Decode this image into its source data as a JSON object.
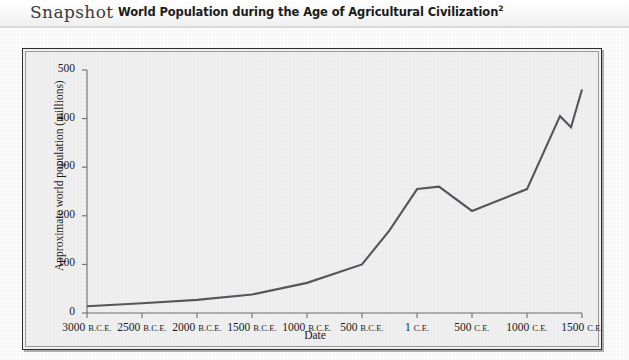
{
  "header": {
    "snapshot_label": "Snapshot",
    "title": "World Population during the Age of Agricultural Civilization",
    "title_superscript": "2"
  },
  "chart_data": {
    "type": "line",
    "title": "World Population during the Age of Agricultural Civilization",
    "xlabel": "Date",
    "ylabel": "Approximate world population (millions)",
    "xlim": [
      -3000,
      1500
    ],
    "ylim": [
      0,
      500
    ],
    "grid": false,
    "legend": null,
    "x_tick_labels": [
      "3000 B.C.E.",
      "2500 B.C.E.",
      "2000 B.C.E.",
      "1500 B.C.E.",
      "1000 B.C.E.",
      "500 B.C.E.",
      "1 C.E.",
      "500 C.E.",
      "1000 C.E.",
      "1500 C.E."
    ],
    "x_tick_values": [
      -3000,
      -2500,
      -2000,
      -1500,
      -1000,
      -500,
      1,
      500,
      1000,
      1500
    ],
    "y_tick_labels": [
      "0",
      "100",
      "200",
      "300",
      "400",
      "500"
    ],
    "y_tick_values": [
      0,
      100,
      200,
      300,
      400,
      500
    ],
    "series": [
      {
        "name": "Approximate world population",
        "color": "#55555a",
        "x": [
          -3000,
          -2500,
          -2000,
          -1500,
          -1000,
          -500,
          -250,
          1,
          200,
          500,
          1000,
          1300,
          1400,
          1500
        ],
        "values": [
          14,
          20,
          27,
          38,
          62,
          100,
          170,
          255,
          260,
          210,
          255,
          405,
          382,
          460
        ]
      }
    ]
  }
}
